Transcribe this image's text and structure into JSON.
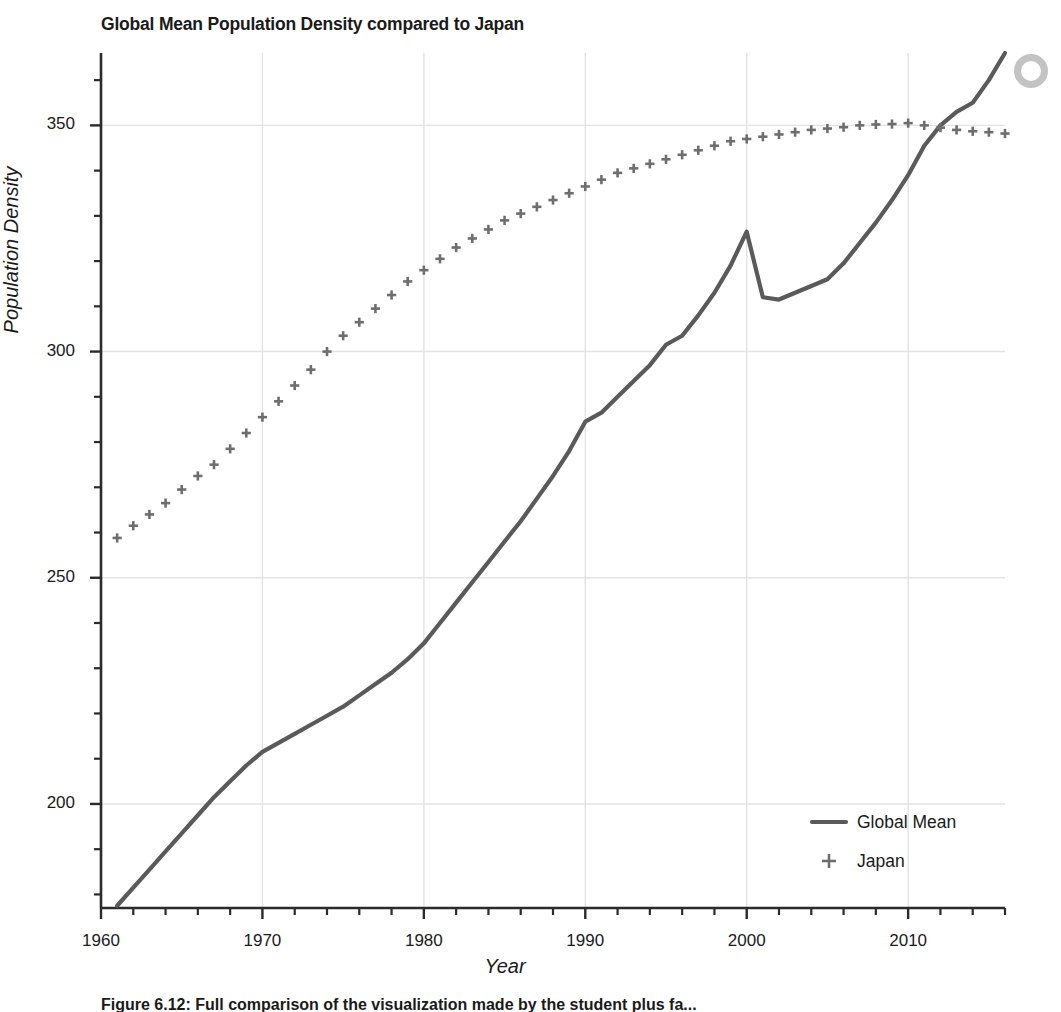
{
  "figure": {
    "title": "Global Mean Population Density compared to Japan",
    "caption": "Figure 6.12: Full comparison of the visualization made by the student plus fa..."
  },
  "axes": {
    "xlabel": "Year",
    "ylabel": "Population Density",
    "xticks": [
      "1960",
      "1970",
      "1980",
      "1990",
      "2000",
      "2010"
    ],
    "yticks": [
      "200",
      "250",
      "300",
      "350"
    ]
  },
  "legend": {
    "entries": [
      {
        "label": "Global Mean",
        "marker": "line",
        "color": "#5a5a5a"
      },
      {
        "label": "Japan",
        "marker": "plus",
        "color": "#6e6e6e"
      }
    ]
  },
  "chart_data": {
    "type": "line",
    "title": "Global Mean Population Density compared to Japan",
    "xlabel": "Year",
    "ylabel": "Population Density",
    "xlim": [
      1960,
      2016
    ],
    "ylim": [
      177,
      366
    ],
    "xticks": [
      1960,
      1970,
      1980,
      1990,
      2000,
      2010
    ],
    "yticks": [
      200,
      250,
      300,
      350
    ],
    "xminor_step": 2,
    "yminor_step": 10,
    "grid": true,
    "legend_position": "lower right",
    "x": [
      1961,
      1962,
      1963,
      1964,
      1965,
      1966,
      1967,
      1968,
      1969,
      1970,
      1971,
      1972,
      1973,
      1974,
      1975,
      1976,
      1977,
      1978,
      1979,
      1980,
      1981,
      1982,
      1983,
      1984,
      1985,
      1986,
      1987,
      1988,
      1989,
      1990,
      1991,
      1992,
      1993,
      1994,
      1995,
      1996,
      1997,
      1998,
      1999,
      2000,
      2001,
      2002,
      2003,
      2004,
      2005,
      2006,
      2007,
      2008,
      2009,
      2010,
      2011,
      2012,
      2013,
      2014,
      2015,
      2016
    ],
    "series": [
      {
        "name": "Global Mean",
        "style": "solid-line",
        "color": "#5a5a5a",
        "values": [
          177.5,
          181.5,
          185.5,
          189.5,
          193.5,
          197.5,
          201.5,
          205.0,
          208.5,
          211.5,
          213.5,
          215.5,
          217.5,
          219.5,
          221.5,
          224.0,
          226.5,
          229.0,
          232.0,
          235.5,
          240.0,
          244.5,
          249.0,
          253.5,
          258.0,
          262.5,
          267.5,
          272.5,
          278.0,
          284.5,
          286.5,
          290.0,
          293.5,
          297.0,
          301.5,
          303.5,
          308.0,
          313.0,
          319.0,
          326.5,
          312.0,
          311.5,
          313.0,
          314.5,
          316.0,
          319.5,
          324.0,
          328.5,
          333.5,
          339.0,
          345.5,
          350.0,
          353.0,
          355.0,
          360.0,
          366.0
        ]
      },
      {
        "name": "Japan",
        "style": "plus-markers",
        "color": "#6e6e6e",
        "values": [
          258.8,
          261.5,
          264.0,
          266.5,
          269.5,
          272.5,
          275.0,
          278.5,
          282.0,
          285.5,
          289.0,
          292.5,
          296.0,
          300.0,
          303.5,
          306.5,
          309.5,
          312.5,
          315.5,
          318.0,
          320.5,
          323.0,
          325.0,
          327.0,
          329.0,
          330.5,
          332.0,
          333.5,
          335.0,
          336.5,
          338.0,
          339.5,
          340.5,
          341.5,
          342.5,
          343.5,
          344.5,
          345.5,
          346.5,
          347.0,
          347.5,
          348.0,
          348.5,
          349.0,
          349.3,
          349.6,
          350.0,
          350.2,
          350.3,
          350.5,
          350.0,
          349.5,
          349.0,
          348.7,
          348.5,
          348.2
        ]
      }
    ]
  },
  "style": {
    "line_color": "#5a5a5a",
    "marker_color": "#6e6e6e",
    "grid_color": "#e3e3e3",
    "axis_color": "#2b2b2b",
    "background": "#ffffff"
  }
}
